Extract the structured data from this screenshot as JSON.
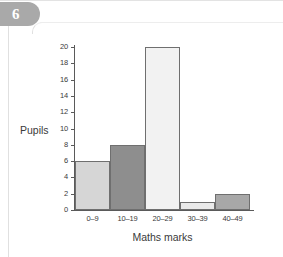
{
  "badge": {
    "number": "6"
  },
  "chart_data": {
    "type": "bar",
    "title": "",
    "xlabel": "Maths marks",
    "ylabel": "Pupils",
    "categories": [
      "0–9",
      "10–19",
      "20–29",
      "30–39",
      "40–49"
    ],
    "values": [
      6,
      8,
      20,
      1,
      2
    ],
    "bar_colors": [
      "#d6d6d6",
      "#8e8e8e",
      "#f2f2f2",
      "#eaeaea",
      "#a8a8a8"
    ],
    "bar_outline_color": "#6f6f6f",
    "ylim": [
      0,
      20
    ],
    "ytick_step": 2,
    "ytick_labels": [
      "0",
      "2",
      "4",
      "6",
      "8",
      "10",
      "12",
      "14",
      "16",
      "18",
      "20"
    ],
    "grid": false,
    "legend": null,
    "contiguous_bars": true
  },
  "colors": {
    "badge_background": "#a9a9a9",
    "badge_text": "#ffffff",
    "axis": "#5a5a5a",
    "text": "#3a3a3a",
    "card_border": "#e0e0e0",
    "page_background": "#ffffff"
  }
}
